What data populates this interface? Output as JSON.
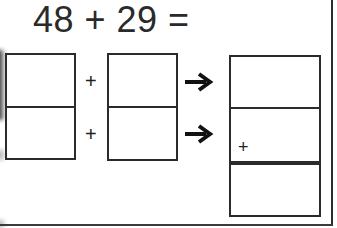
{
  "problem": {
    "equation": "48 + 29 ="
  },
  "rows": [
    {
      "operator": "+"
    },
    {
      "operator": "+"
    }
  ],
  "result_box": {
    "inner_operator": "+"
  },
  "icons": {
    "arrow": "arrow-right-icon"
  },
  "colors": {
    "ink": "#2b2b2b",
    "background": "#ffffff"
  }
}
